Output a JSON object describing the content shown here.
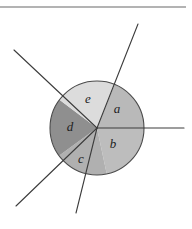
{
  "figure": {
    "type": "geometry-diagram",
    "background_color": "#ffffff",
    "top_rule": {
      "present": true,
      "color": "#9a9a9a",
      "y": 7,
      "x_start": 0,
      "x_end": 186
    },
    "circle": {
      "center_x": 97,
      "center_y": 128,
      "radius": 47,
      "outline_color": "#4a4a4a",
      "outline_width": 1.1
    },
    "line_color": "#3c3c3c",
    "line_width": 1.1,
    "rays": [
      {
        "name": "ray-right",
        "angle_deg": 0,
        "end_x": 184,
        "end_y": 128
      },
      {
        "name": "ray-upper-right",
        "angle_deg": 68,
        "end_x": 138,
        "end_y": 24
      },
      {
        "name": "ray-upper-left",
        "angle_deg": 143,
        "end_x": 14,
        "end_y": 50
      },
      {
        "name": "ray-lower-left",
        "angle_deg": 216,
        "end_x": 16,
        "end_y": 206
      },
      {
        "name": "ray-down",
        "angle_deg": 282,
        "end_x": 76,
        "end_y": 213
      }
    ],
    "sectors": [
      {
        "id": "a",
        "label": "a",
        "start_angle_deg": 0,
        "end_angle_deg": 68,
        "fill": "#b9b9b9",
        "label_x": 117,
        "label_y": 113
      },
      {
        "id": "b",
        "label": "b",
        "start_angle_deg": 282,
        "end_angle_deg": 360,
        "fill": "#bdbdbd",
        "label_x": 113,
        "label_y": 148
      },
      {
        "id": "c",
        "label": "c",
        "start_angle_deg": 216,
        "end_angle_deg": 282,
        "fill": "#b0b0b0",
        "label_x": 81,
        "label_y": 163
      },
      {
        "id": "d",
        "label": "d",
        "start_angle_deg": 143,
        "end_angle_deg": 216,
        "fill": "#8f8f8f",
        "label_x": 70,
        "label_y": 131
      },
      {
        "id": "e",
        "label": "e",
        "start_angle_deg": 68,
        "end_angle_deg": 143,
        "fill": "#dcdcdc",
        "label_x": 88,
        "label_y": 103
      }
    ]
  }
}
